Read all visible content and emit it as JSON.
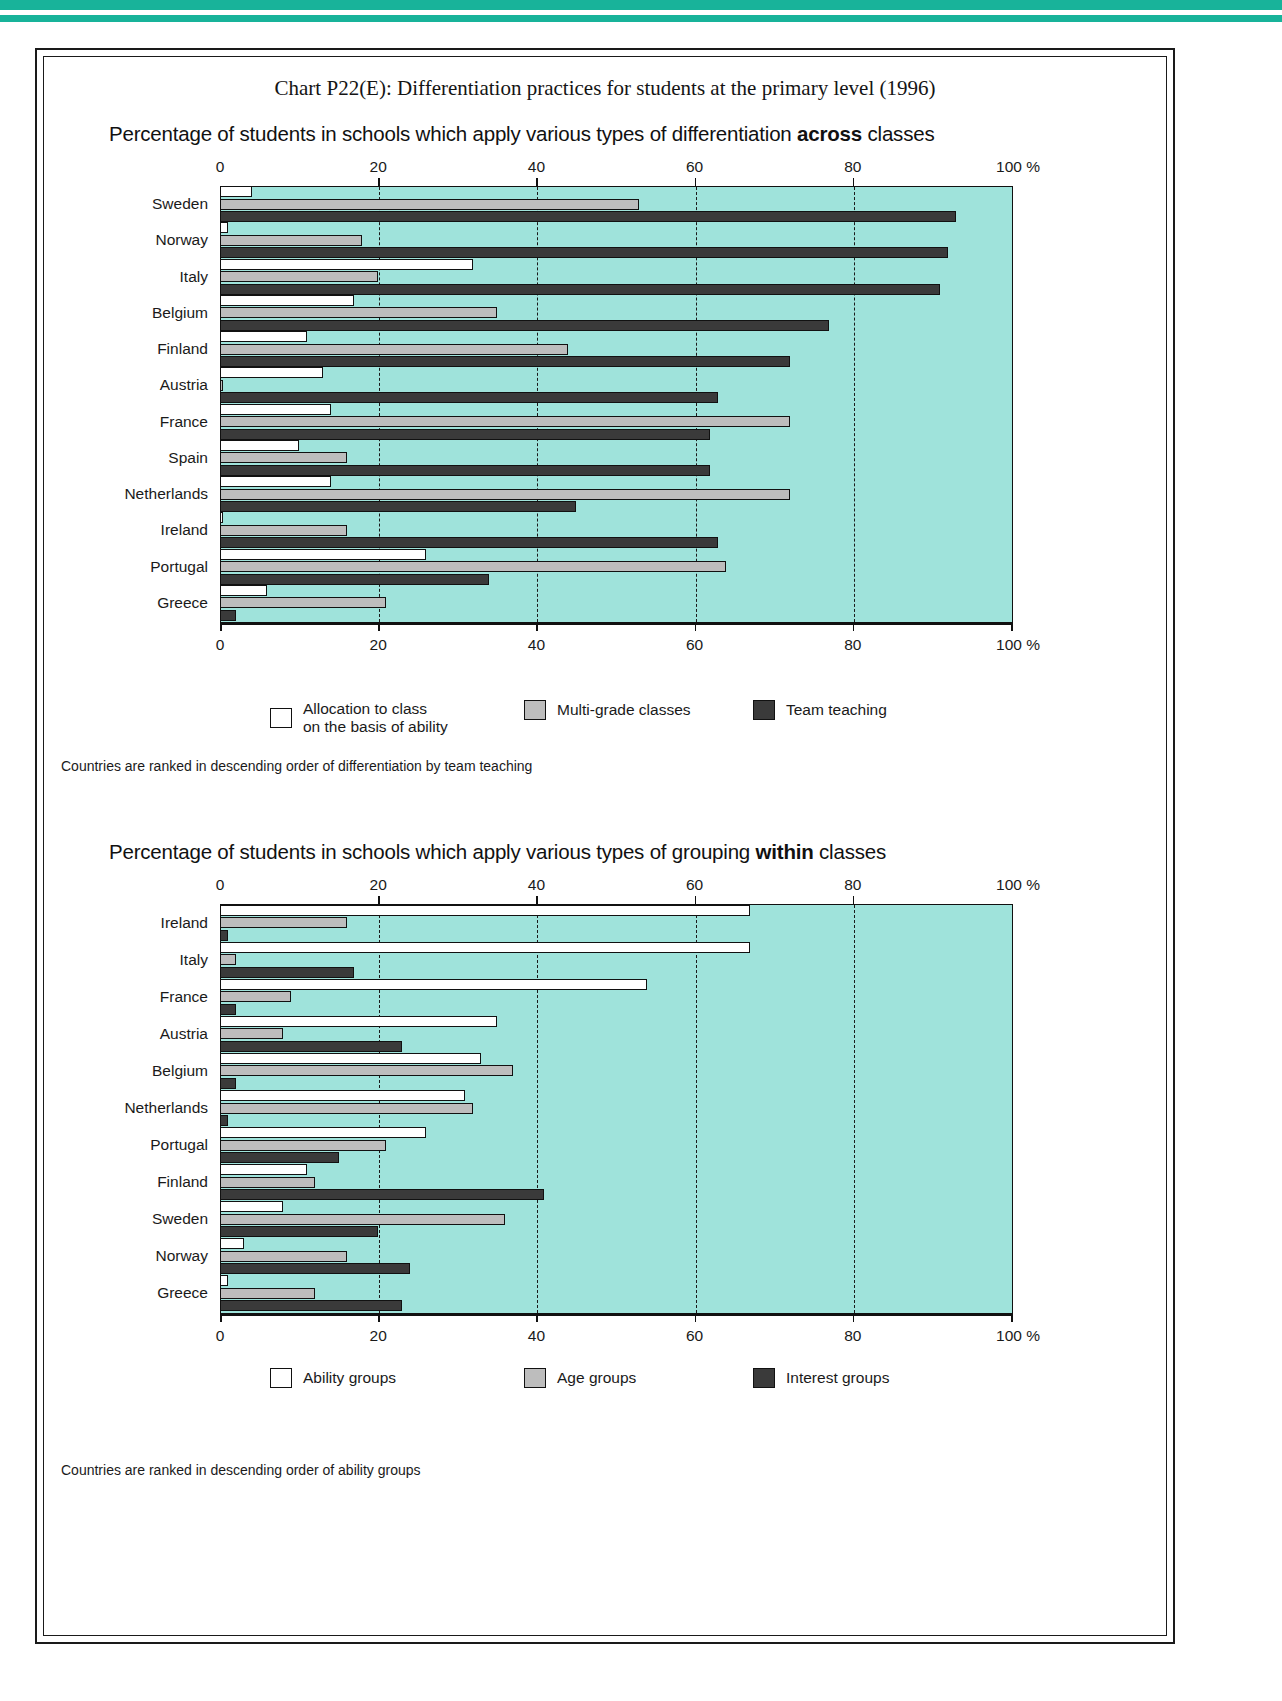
{
  "document": {
    "chart_title": "Chart P22(E): Differentiation practices for students at the primary level (1996)"
  },
  "panel_across": {
    "subtitle_pre": "Percentage of students in schools which apply various types of differentiation ",
    "subtitle_bold": "across",
    "subtitle_post": " classes",
    "axis_ticks": [
      "0",
      "20",
      "40",
      "60",
      "80",
      "100  %"
    ],
    "footnote": "Countries are ranked in descending order of differentiation by team teaching",
    "legend": [
      {
        "key": "s0",
        "label": "Allocation to class\non the basis of ability"
      },
      {
        "key": "s1",
        "label": "Multi-grade classes"
      },
      {
        "key": "s2",
        "label": "Team teaching"
      }
    ]
  },
  "panel_within": {
    "subtitle_pre": "Percentage of students in schools which apply various types of grouping ",
    "subtitle_bold": "within",
    "subtitle_post": " classes",
    "axis_ticks": [
      "0",
      "20",
      "40",
      "60",
      "80",
      "100  %"
    ],
    "footnote": "Countries are ranked in descending order of ability groups",
    "legend": [
      {
        "key": "s0",
        "label": "Ability groups"
      },
      {
        "key": "s1",
        "label": "Age groups"
      },
      {
        "key": "s2",
        "label": "Interest groups"
      }
    ]
  },
  "colors": {
    "plot_background": "#9fe3db",
    "series_allocation": "#ffffff",
    "series_multigrade": "#bdbdbd",
    "series_team": "#3a3a3a",
    "rule_accent": "#18b39a",
    "ink": "#111111"
  },
  "chart_data": [
    {
      "type": "bar",
      "orientation": "horizontal",
      "title": "Percentage of students in schools which apply various types of differentiation across classes",
      "xlabel": "%",
      "ylabel": "",
      "xlim": [
        0,
        100
      ],
      "xticks": [
        0,
        20,
        40,
        60,
        80,
        100
      ],
      "grid": "vertical-dashed",
      "legend_position": "below",
      "categories": [
        "Sweden",
        "Norway",
        "Italy",
        "Belgium",
        "Finland",
        "Austria",
        "France",
        "Spain",
        "Netherlands",
        "Ireland",
        "Portugal",
        "Greece"
      ],
      "series": [
        {
          "name": "Allocation to class on the basis of ability",
          "values": [
            4,
            1,
            32,
            17,
            11,
            13,
            14,
            10,
            14,
            0,
            26,
            6
          ]
        },
        {
          "name": "Multi-grade classes",
          "values": [
            53,
            18,
            20,
            35,
            44,
            0,
            72,
            16,
            72,
            16,
            64,
            21
          ]
        },
        {
          "name": "Team teaching",
          "values": [
            93,
            92,
            91,
            77,
            72,
            63,
            62,
            62,
            45,
            63,
            34,
            2
          ]
        }
      ]
    },
    {
      "type": "bar",
      "orientation": "horizontal",
      "title": "Percentage of students in schools which apply various types of grouping within classes",
      "xlabel": "%",
      "ylabel": "",
      "xlim": [
        0,
        100
      ],
      "xticks": [
        0,
        20,
        40,
        60,
        80,
        100
      ],
      "grid": "vertical-dashed",
      "legend_position": "below",
      "categories": [
        "Ireland",
        "Italy",
        "France",
        "Austria",
        "Belgium",
        "Netherlands",
        "Portugal",
        "Finland",
        "Sweden",
        "Norway",
        "Greece"
      ],
      "series": [
        {
          "name": "Ability groups",
          "values": [
            67,
            67,
            54,
            35,
            33,
            31,
            26,
            11,
            8,
            3,
            1
          ]
        },
        {
          "name": "Age groups",
          "values": [
            16,
            2,
            9,
            8,
            37,
            32,
            21,
            12,
            36,
            16,
            12
          ]
        },
        {
          "name": "Interest groups",
          "values": [
            1,
            17,
            2,
            23,
            2,
            1,
            15,
            41,
            20,
            24,
            23
          ]
        }
      ]
    }
  ]
}
